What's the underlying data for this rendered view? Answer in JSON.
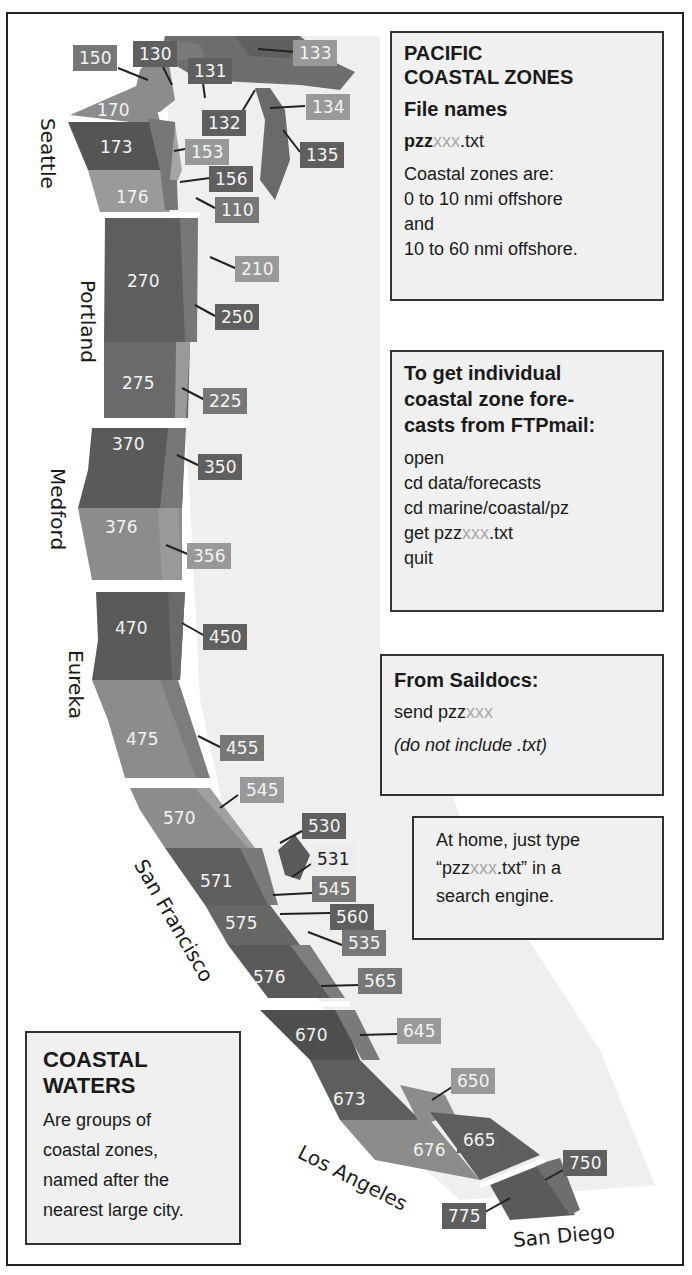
{
  "title_box": {
    "title_line1": "PACIFIC",
    "title_line2": "COASTAL ZONES",
    "subtitle": "File names",
    "filename_prefix": "pzz",
    "filename_var": "xxx",
    "filename_suffix": ".txt",
    "lines": [
      "Coastal zones are:",
      "0 to 10 nmi offshore",
      "and",
      "10 to 60 nmi offshore."
    ]
  },
  "ftpmail_box": {
    "heading_lines": [
      "To get individual",
      "coastal zone fore-",
      "casts from FTPmail:"
    ],
    "commands": [
      "open",
      "cd data/forecasts",
      "cd marine/coastal/pz"
    ],
    "get_prefix": "get pzz",
    "get_var": "xxx",
    "get_suffix": ".txt",
    "quit": "quit"
  },
  "saildocs_box": {
    "heading": "From Saildocs:",
    "send_prefix": "send pzz",
    "send_var": "xxx",
    "note": "(do not include .txt)"
  },
  "home_box": {
    "line1": "At home, just type",
    "line2_prefix": "“pzz",
    "line2_var": "xxx",
    "line2_suffix": ".txt” in a",
    "line3": "search engine."
  },
  "legend_box": {
    "title_line1": "COASTAL",
    "title_line2": "WATERS",
    "lines": [
      "Are groups of",
      "coastal zones,",
      "named after the",
      "nearest large city."
    ]
  },
  "cities": [
    "Seattle",
    "Portland",
    "Medford",
    "Eureka",
    "San Francisco",
    "Los Angeles",
    "San Diego"
  ],
  "offshore_zones": [
    "170",
    "173",
    "176",
    "270",
    "275",
    "370",
    "376",
    "470",
    "475",
    "570",
    "571",
    "575",
    "576",
    "670",
    "673",
    "676"
  ],
  "coastal_zone_tags": [
    "150",
    "130",
    "131",
    "133",
    "132",
    "134",
    "135",
    "153",
    "156",
    "110",
    "210",
    "250",
    "225",
    "350",
    "356",
    "450",
    "455",
    "545",
    "530",
    "531",
    "545",
    "560",
    "535",
    "565",
    "645",
    "650",
    "665",
    "750",
    "775"
  ],
  "colors": {
    "zone_dark": "#5a5a5a",
    "zone_mid": "#6e6e6e",
    "zone_light": "#8c8c8c",
    "land": "#efefef",
    "filename_var": "#a8a8a8"
  }
}
